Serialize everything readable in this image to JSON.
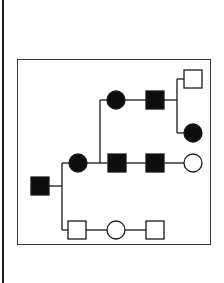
{
  "diagram": {
    "type": "pedigree",
    "colors": {
      "stroke": "#1a1a1a",
      "affected": "#0d0d0d",
      "unaffected": "#ffffff",
      "frame": "#3a3a3a"
    },
    "symbol_size": 18,
    "individuals": [
      {
        "id": "I-1",
        "sex": "male",
        "affected": true,
        "x": 40,
        "y": 186
      },
      {
        "id": "II-1",
        "sex": "female",
        "affected": true,
        "x": 78,
        "y": 163
      },
      {
        "id": "II-2",
        "sex": "male",
        "affected": true,
        "x": 117,
        "y": 163
      },
      {
        "id": "II-3",
        "sex": "male",
        "affected": true,
        "x": 155,
        "y": 163
      },
      {
        "id": "II-4",
        "sex": "female",
        "affected": false,
        "x": 193,
        "y": 163
      },
      {
        "id": "II-5",
        "sex": "male",
        "affected": false,
        "x": 77,
        "y": 230
      },
      {
        "id": "II-6",
        "sex": "female",
        "affected": false,
        "x": 116,
        "y": 230
      },
      {
        "id": "II-7",
        "sex": "male",
        "affected": false,
        "x": 155,
        "y": 230
      },
      {
        "id": "III-1",
        "sex": "female",
        "affected": true,
        "x": 116,
        "y": 100
      },
      {
        "id": "III-2",
        "sex": "male",
        "affected": true,
        "x": 155,
        "y": 100
      },
      {
        "id": "IV-1",
        "sex": "male",
        "affected": false,
        "x": 193,
        "y": 79
      },
      {
        "id": "IV-2",
        "sex": "female",
        "affected": true,
        "x": 193,
        "y": 133
      }
    ],
    "lines": [
      {
        "x1": 49,
        "y1": 186,
        "x2": 62,
        "y2": 186
      },
      {
        "x1": 62,
        "y1": 163,
        "x2": 62,
        "y2": 230
      },
      {
        "x1": 62,
        "y1": 163,
        "x2": 69,
        "y2": 163
      },
      {
        "x1": 87,
        "y1": 163,
        "x2": 108,
        "y2": 163
      },
      {
        "x1": 126,
        "y1": 163,
        "x2": 146,
        "y2": 163
      },
      {
        "x1": 164,
        "y1": 163,
        "x2": 184,
        "y2": 163
      },
      {
        "x1": 100,
        "y1": 100,
        "x2": 100,
        "y2": 163
      },
      {
        "x1": 100,
        "y1": 100,
        "x2": 107,
        "y2": 100
      },
      {
        "x1": 125,
        "y1": 100,
        "x2": 146,
        "y2": 100
      },
      {
        "x1": 164,
        "y1": 100,
        "x2": 177,
        "y2": 100
      },
      {
        "x1": 177,
        "y1": 79,
        "x2": 177,
        "y2": 133
      },
      {
        "x1": 177,
        "y1": 79,
        "x2": 184,
        "y2": 79
      },
      {
        "x1": 177,
        "y1": 133,
        "x2": 184,
        "y2": 133
      },
      {
        "x1": 62,
        "y1": 230,
        "x2": 68,
        "y2": 230
      },
      {
        "x1": 86,
        "y1": 230,
        "x2": 107,
        "y2": 230
      },
      {
        "x1": 125,
        "y1": 230,
        "x2": 146,
        "y2": 230
      }
    ]
  }
}
